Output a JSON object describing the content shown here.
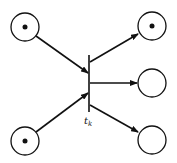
{
  "diagram": {
    "type": "petri-net",
    "transition": {
      "label": "t",
      "subscript": "k"
    },
    "input_places": [
      {
        "id": "p_in_1",
        "tokens": 1
      },
      {
        "id": "p_in_2",
        "tokens": 1
      }
    ],
    "output_places": [
      {
        "id": "p_out_1",
        "tokens": 1
      },
      {
        "id": "p_out_2",
        "tokens": 0
      },
      {
        "id": "p_out_3",
        "tokens": 0
      }
    ],
    "colors": {
      "stroke": "#111111",
      "background": "#ffffff"
    }
  }
}
